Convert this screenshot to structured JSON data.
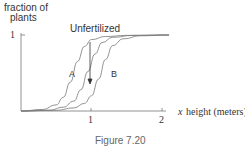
{
  "chart_data": {
    "type": "line",
    "title": "",
    "ylabel": "fraction of plants",
    "xlabel": "height (meters)",
    "x_axis_symbol": "x",
    "xticks": [
      "1",
      "2"
    ],
    "yticks": [
      "1"
    ],
    "xlim": [
      0,
      2.1
    ],
    "ylim": [
      0,
      1
    ],
    "grid": false,
    "annotation": "Unfertilized",
    "series": [
      {
        "name": "A",
        "x": [
          0,
          0.3,
          0.5,
          0.6,
          0.7,
          0.8,
          0.9,
          1.0,
          1.2,
          1.5,
          2.1
        ],
        "values": [
          0,
          0.02,
          0.08,
          0.18,
          0.38,
          0.65,
          0.85,
          0.94,
          0.98,
          0.995,
          1.0
        ]
      },
      {
        "name": "Unfertilized",
        "x": [
          0,
          0.4,
          0.6,
          0.75,
          0.85,
          0.95,
          1.05,
          1.15,
          1.3,
          1.6,
          2.1
        ],
        "values": [
          0,
          0.01,
          0.05,
          0.13,
          0.28,
          0.52,
          0.75,
          0.9,
          0.97,
          0.995,
          1.0
        ]
      },
      {
        "name": "B",
        "x": [
          0,
          0.5,
          0.75,
          0.9,
          1.0,
          1.1,
          1.2,
          1.3,
          1.45,
          1.7,
          2.1
        ],
        "values": [
          0,
          0.01,
          0.04,
          0.1,
          0.2,
          0.42,
          0.68,
          0.86,
          0.95,
          0.99,
          1.0
        ]
      }
    ]
  },
  "labels": {
    "ylabel_line1": "fraction of",
    "ylabel_line2": "plants",
    "ytick_1": "1",
    "xtick_1": "1",
    "xtick_2": "2",
    "x_symbol": "x",
    "xlabel": "height (meters)",
    "annotation": "Unfertilized",
    "curve_a": "A",
    "curve_b": "B",
    "caption": "Figure 7.20"
  }
}
